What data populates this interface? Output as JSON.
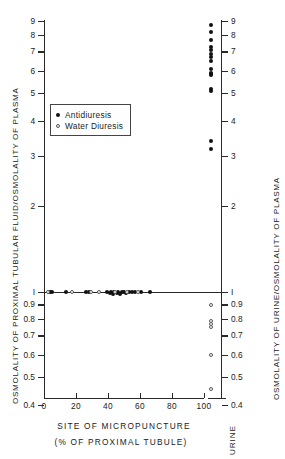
{
  "chart_data": {
    "type": "scatter",
    "title": "",
    "xlabel": "SITE OF MICROPUNCTURE",
    "xlabel_sub": "(% OF PROXIMAL TUBULE)",
    "ylabel_left": "OSMOLALITY OF PROXIMAL TUBULAR FLUID/OSMOLALITY OF PLASMA",
    "ylabel_right": "OSMOLALITY OF URINE/OSMOLALITY OF PLASMA",
    "yscale": "log",
    "ylim": [
      0.4,
      9
    ],
    "xlim": [
      0,
      100
    ],
    "grid": false,
    "legend_position": "upper-left-inside",
    "y_ticks": [
      "9",
      "8",
      "7",
      "6",
      "5",
      "4",
      "3",
      "2",
      "1",
      "0.9",
      "0.8",
      "0.7",
      "0.6",
      "0.5",
      "0.4"
    ],
    "y_tick_values": [
      9,
      8,
      7,
      6,
      5,
      4,
      3,
      2,
      1,
      0.9,
      0.8,
      0.7,
      0.6,
      0.5,
      0.4
    ],
    "x_ticks": [
      "0",
      "20",
      "40",
      "60",
      "80",
      "100"
    ],
    "x_tick_values": [
      0,
      20,
      40,
      60,
      80,
      100
    ],
    "urine_column_label": "URINE",
    "series": [
      {
        "name": "Antidiuresis",
        "marker": "filled-circle",
        "color": "#111111",
        "tubule_points": [
          {
            "x": 3.5,
            "y": 1.0
          },
          {
            "x": 5.0,
            "y": 1.0
          },
          {
            "x": 13.5,
            "y": 1.0
          },
          {
            "x": 26.5,
            "y": 1.0
          },
          {
            "x": 28.0,
            "y": 1.0
          },
          {
            "x": 39.5,
            "y": 1.0
          },
          {
            "x": 41.0,
            "y": 0.99
          },
          {
            "x": 42.0,
            "y": 1.0
          },
          {
            "x": 43.0,
            "y": 0.98
          },
          {
            "x": 44.0,
            "y": 1.0
          },
          {
            "x": 45.5,
            "y": 0.99
          },
          {
            "x": 46.5,
            "y": 1.0
          },
          {
            "x": 47.5,
            "y": 0.98
          },
          {
            "x": 48.5,
            "y": 1.0
          },
          {
            "x": 50.0,
            "y": 1.0
          },
          {
            "x": 51.5,
            "y": 0.99
          },
          {
            "x": 53.0,
            "y": 1.0
          },
          {
            "x": 55.0,
            "y": 1.0
          },
          {
            "x": 57.0,
            "y": 1.0
          },
          {
            "x": 60.5,
            "y": 1.0
          },
          {
            "x": 66.0,
            "y": 1.0
          }
        ],
        "urine_points": [
          8.7,
          8.2,
          7.7,
          7.3,
          7.1,
          6.9,
          6.7,
          6.5,
          6.1,
          5.9,
          5.85,
          5.8,
          5.2,
          5.1,
          3.4,
          3.2
        ]
      },
      {
        "name": "Water Diuresis",
        "marker": "open-circle",
        "color": "#555555",
        "tubule_points": [
          {
            "x": 2.5,
            "y": 1.0
          },
          {
            "x": 17.5,
            "y": 1.0
          },
          {
            "x": 29.5,
            "y": 1.0
          },
          {
            "x": 34.5,
            "y": 1.0
          },
          {
            "x": 44.5,
            "y": 1.0
          },
          {
            "x": 52.0,
            "y": 1.0
          },
          {
            "x": 58.5,
            "y": 1.0
          }
        ],
        "urine_points": [
          0.9,
          0.79,
          0.77,
          0.755,
          0.6,
          0.455
        ]
      }
    ]
  },
  "legend": {
    "items": [
      {
        "label": "Antidiuresis",
        "marker": "filled"
      },
      {
        "label": "Water  Diuresis",
        "marker": "open"
      }
    ]
  }
}
